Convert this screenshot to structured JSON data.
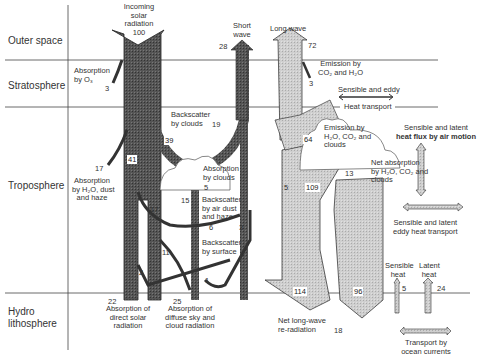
{
  "layers": [
    {
      "name": "Outer space"
    },
    {
      "name": "Stratosphere"
    },
    {
      "name": "Troposphere"
    },
    {
      "name": "Hydro\nlithosphere",
      "line1": "Hydro",
      "line2": "lithosphere"
    }
  ],
  "labels": {
    "incoming": {
      "line1": "Incoming",
      "line2": "solar",
      "line3": "radiation",
      "value": "100"
    },
    "short_wave": {
      "line1": "Short",
      "line2": "wave",
      "value": "28"
    },
    "long_wave": {
      "text": "Long wave",
      "value": "72"
    },
    "absorption_o3": {
      "line1": "Absorption",
      "line2": "by O₃",
      "value": "3"
    },
    "emission_co2_h2o": {
      "line1": "Emission by",
      "line2": "CO₂ and H₂O",
      "value": "3"
    },
    "sensible_eddy": {
      "line1": "Sensible and eddy",
      "line2": "Heat transport"
    },
    "backscatter_clouds": {
      "line1": "Backscatter",
      "line2": "by clouds",
      "value": "19"
    },
    "flow_39": "39",
    "flow_41": "41",
    "absorption_h2o_dust": {
      "line1": "Absorption",
      "line2": "by H₂O, dust",
      "line3": "and haze",
      "value": "17"
    },
    "absorption_clouds": {
      "line1": "Absorption",
      "line2": "by clouds",
      "value": "5"
    },
    "backscatter_air": {
      "line1": "Backscatter",
      "line2": "by air dust",
      "line3": "and haze",
      "value": "6",
      "value2": "3"
    },
    "backscatter_surface": {
      "line1": "Backscatter",
      "line2": "by surface",
      "value": "1"
    },
    "flow_15": "15",
    "flow_17b": "17",
    "flow_11": "11",
    "flow_2": "2",
    "absorption_direct": {
      "line1": "Absorption of",
      "line2": "direct solar",
      "line3": "radiation",
      "value": "22"
    },
    "absorption_diffuse": {
      "line1": "Absorption of",
      "line2": "diffuse sky and",
      "line3": "cloud radiation",
      "value": "25"
    },
    "emission_h2o_co2_clouds": {
      "line1": "Emission by",
      "line2": "H₂O, CO₂ and",
      "line3": "clouds",
      "value": "64"
    },
    "net_absorption": {
      "line1": "Net absorption",
      "line2": "by H₂O, CO₂ and",
      "line3": "clouds",
      "value": "13"
    },
    "flow_5": "5",
    "flow_109": "109",
    "flow_114": "114",
    "flow_96": "96",
    "net_longwave": {
      "line1": "Net long-wave",
      "line2": "re-radiation",
      "value": "18"
    },
    "sensible_latent_air": {
      "line1": "Sensible and latent",
      "line2": "heat flux by air motion"
    },
    "sensible_latent_eddy": {
      "line1": "Sensible and latent",
      "line2": "eddy heat transport"
    },
    "sensible_heat": {
      "line1": "Sensible",
      "line2": "heat",
      "value": "5"
    },
    "latent_heat": {
      "line1": "Latent",
      "line2": "heat",
      "value": "24"
    },
    "ocean_transport": {
      "line1": "Transport by",
      "line2": "ocean currents"
    }
  },
  "colors": {
    "shortwave": "#4a4a4a",
    "longwave": "#c8c8c8",
    "line": "#333333"
  }
}
